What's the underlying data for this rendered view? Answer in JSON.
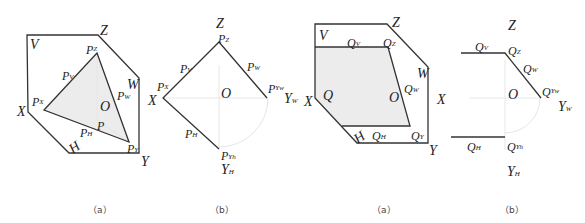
{
  "figures": [
    {
      "id": "fig-left-a",
      "caption": "（a）",
      "labels": {
        "V": "V",
        "Z": "Z",
        "W": "W",
        "X": "X",
        "Y": "Y",
        "H": "H",
        "O": "O",
        "P": "P",
        "Pz": "P",
        "Pz_sub": "Z",
        "Pv": "P",
        "Pv_sub": "V",
        "Px": "P",
        "Px_sub": "X",
        "Pw": "P",
        "Pw_sub": "W",
        "Ph": "P",
        "Ph_sub": "H",
        "Py": "P",
        "Py_sub": "Y"
      }
    },
    {
      "id": "fig-left-b",
      "caption": "（b）",
      "labels": {
        "Z": "Z",
        "X": "X",
        "O": "O",
        "Pz": "P",
        "Pz_sub": "Z",
        "Pv": "P",
        "Pv_sub": "V",
        "Px": "P",
        "Px_sub": "X",
        "Pw": "P",
        "Pw_sub": "W",
        "Ph": "P",
        "Ph_sub": "H",
        "Pyw": "P",
        "Pyw_sub": "Yw",
        "Yw": "Y",
        "Yw_sub": "W",
        "Pyh": "P",
        "Pyh_sub": "Yh",
        "Yh": "Y",
        "Yh_sub": "H"
      }
    },
    {
      "id": "fig-right-a",
      "caption": "（a）",
      "labels": {
        "V": "V",
        "Z": "Z",
        "W": "W",
        "X": "X",
        "X2": "X",
        "Y": "Y",
        "H": "H",
        "O": "O",
        "Q": "Q",
        "Qv": "Q",
        "Qv_sub": "V",
        "Qz": "Q",
        "Qz_sub": "Z",
        "Qw": "Q",
        "Qw_sub": "W",
        "Qh": "Q",
        "Qh_sub": "H",
        "Qy": "Q",
        "Qy_sub": "Y"
      }
    },
    {
      "id": "fig-right-b",
      "caption": "（b）",
      "labels": {
        "Z": "Z",
        "O": "O",
        "Qv": "Q",
        "Qv_sub": "V",
        "Qz": "Q",
        "Qz_sub": "Z",
        "Qw": "Q",
        "Qw_sub": "W",
        "Qyw": "Q",
        "Qyw_sub": "Yw",
        "Yw": "Y",
        "Yw_sub": "W",
        "Qh": "Q",
        "Qh_sub": "H",
        "Qyh": "Q",
        "Qyh_sub": "Yh",
        "Yh": "Y",
        "Yh_sub": "H"
      }
    }
  ],
  "colors": {
    "line": "#333333",
    "fill": "#ececec",
    "axis": "#e6e6e6"
  }
}
